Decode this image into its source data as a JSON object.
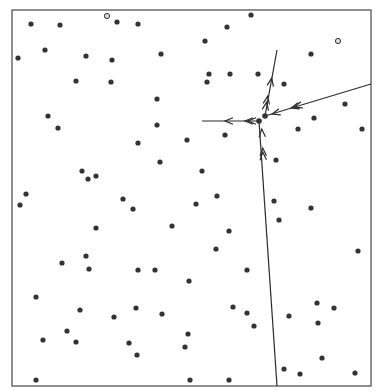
{
  "figure": {
    "frame": {
      "x": 12,
      "y": 10,
      "w": 359,
      "h": 376
    },
    "colors": {
      "ink": "#2a2a2a",
      "dot": "#333333",
      "frame": "#555555",
      "paper": "#ffffff"
    },
    "dots": [
      [
        31,
        24
      ],
      [
        60,
        25
      ],
      [
        107,
        16
      ],
      [
        117,
        22
      ],
      [
        138,
        24
      ],
      [
        227,
        27
      ],
      [
        251,
        15
      ],
      [
        18,
        58
      ],
      [
        45,
        50
      ],
      [
        86,
        56
      ],
      [
        112,
        60
      ],
      [
        161,
        54
      ],
      [
        205,
        41
      ],
      [
        338,
        41
      ],
      [
        311,
        54
      ],
      [
        76,
        81
      ],
      [
        111,
        82
      ],
      [
        157,
        99
      ],
      [
        209,
        74
      ],
      [
        207,
        82
      ],
      [
        230,
        74
      ],
      [
        258,
        74
      ],
      [
        284,
        84
      ],
      [
        48,
        116
      ],
      [
        58,
        128
      ],
      [
        157,
        125
      ],
      [
        345,
        104
      ],
      [
        362,
        129
      ],
      [
        314,
        118
      ],
      [
        298,
        129
      ],
      [
        225,
        135
      ],
      [
        138,
        143
      ],
      [
        187,
        140
      ],
      [
        160,
        162
      ],
      [
        82,
        171
      ],
      [
        88,
        179
      ],
      [
        96,
        176
      ],
      [
        276,
        160
      ],
      [
        26,
        194
      ],
      [
        20,
        205
      ],
      [
        123,
        199
      ],
      [
        133,
        209
      ],
      [
        202,
        171
      ],
      [
        217,
        196
      ],
      [
        196,
        204
      ],
      [
        274,
        201
      ],
      [
        311,
        208
      ],
      [
        279,
        220
      ],
      [
        96,
        228
      ],
      [
        172,
        226
      ],
      [
        229,
        231
      ],
      [
        216,
        249
      ],
      [
        358,
        251
      ],
      [
        86,
        256
      ],
      [
        62,
        263
      ],
      [
        89,
        269
      ],
      [
        138,
        270
      ],
      [
        155,
        270
      ],
      [
        247,
        270
      ],
      [
        189,
        281
      ],
      [
        36,
        297
      ],
      [
        80,
        310
      ],
      [
        114,
        317
      ],
      [
        136,
        308
      ],
      [
        162,
        314
      ],
      [
        233,
        307
      ],
      [
        247,
        313
      ],
      [
        254,
        326
      ],
      [
        289,
        316
      ],
      [
        317,
        303
      ],
      [
        334,
        308
      ],
      [
        318,
        323
      ],
      [
        67,
        331
      ],
      [
        43,
        340
      ],
      [
        76,
        342
      ],
      [
        129,
        343
      ],
      [
        137,
        355
      ],
      [
        185,
        347
      ],
      [
        188,
        334
      ],
      [
        322,
        358
      ],
      [
        36,
        380
      ],
      [
        190,
        380
      ],
      [
        229,
        380
      ],
      [
        284,
        369
      ],
      [
        300,
        374
      ],
      [
        355,
        373
      ]
    ],
    "open_dots": [
      [
        107,
        16
      ],
      [
        338,
        41
      ]
    ],
    "junction_dots": [
      [
        259,
        121
      ],
      [
        265,
        116
      ]
    ],
    "tracks": [
      {
        "name": "track-up",
        "from": [
          265,
          116
        ],
        "to": [
          277,
          50
        ]
      },
      {
        "name": "track-left",
        "from": [
          259,
          121
        ],
        "to": [
          202,
          121
        ]
      },
      {
        "name": "track-right",
        "from": [
          265,
          116
        ],
        "to": [
          371,
          84
        ]
      },
      {
        "name": "track-down",
        "from": [
          259,
          121
        ],
        "to": [
          277,
          386
        ]
      }
    ],
    "arrows": [
      {
        "track": "track-up",
        "at": [
          271,
          82
        ],
        "dir": "up"
      },
      {
        "track": "track-up",
        "at": [
          267,
          100
        ],
        "dir": "up"
      },
      {
        "track": "track-up",
        "at": [
          266,
          106
        ],
        "dir": "up"
      },
      {
        "track": "track-left",
        "at": [
          229,
          121
        ],
        "dir": "left"
      },
      {
        "track": "track-left",
        "at": [
          249,
          121
        ],
        "dir": "left"
      },
      {
        "track": "track-left",
        "at": [
          252,
          121
        ],
        "dir": "left"
      },
      {
        "track": "track-right",
        "at": [
          295,
          107
        ],
        "dir": "left"
      },
      {
        "track": "track-right",
        "at": [
          298,
          106
        ],
        "dir": "left"
      },
      {
        "track": "track-right",
        "at": [
          276,
          113
        ],
        "dir": "left"
      },
      {
        "track": "track-down",
        "at": [
          262,
          133
        ],
        "dir": "up"
      },
      {
        "track": "track-down",
        "at": [
          263,
          152
        ],
        "dir": "up"
      },
      {
        "track": "track-down",
        "at": [
          263,
          156
        ],
        "dir": "up"
      }
    ]
  }
}
